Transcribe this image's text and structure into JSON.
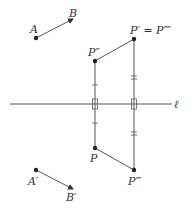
{
  "labels": {
    "A": "A",
    "B": "B",
    "A_prime": "A′",
    "B_prime": "B′",
    "P": "P",
    "P_double": "P″",
    "P_triple": "P‴",
    "P_prime_eq": "P′ = P⁗",
    "line_l": "ℓ"
  },
  "colors": {
    "stroke": "#555555",
    "point": "#222222",
    "text": "#333333"
  }
}
